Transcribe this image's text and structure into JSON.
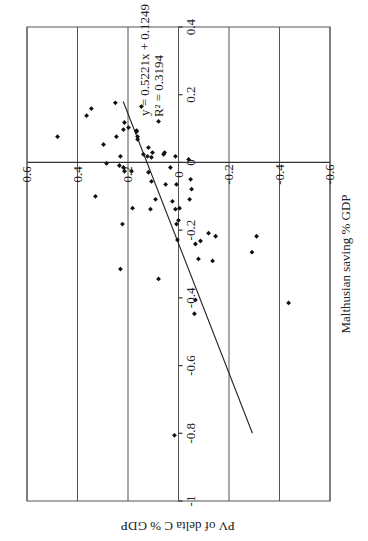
{
  "chart_data": {
    "type": "scatter",
    "orientation_note": "figure rotated 90 degrees clockwise on page",
    "title": "",
    "xlabel": "Malthusian saving % GDP",
    "ylabel": "PV of delta C % GDP",
    "xlim": [
      -1,
      0.4
    ],
    "ylim": [
      -0.6,
      0.6
    ],
    "x_ticks": [
      "-1",
      "-0.8",
      "-0.6",
      "-0.4",
      "-0.2",
      "0",
      "0.2",
      "0.4"
    ],
    "y_ticks": [
      "0.6",
      "0.4",
      "0.2",
      "0",
      "-0.2",
      "-0.4",
      "-0.6"
    ],
    "grid": true,
    "trendline": {
      "equation": "y = 0.5221x + 0.1249",
      "r_squared": "R² = 0.3194",
      "slope": 0.5221,
      "intercept": 0.1249,
      "x_range": [
        -0.8,
        0.18
      ]
    },
    "points": [
      {
        "x": 0.076,
        "y": 0.479
      },
      {
        "x": 0.138,
        "y": 0.364
      },
      {
        "x": 0.159,
        "y": 0.345
      },
      {
        "x": 0.176,
        "y": 0.25
      },
      {
        "x": 0.076,
        "y": 0.246
      },
      {
        "x": 0.053,
        "y": 0.297
      },
      {
        "x": 0.018,
        "y": 0.23
      },
      {
        "x": 0.118,
        "y": 0.214
      },
      {
        "x": 0.097,
        "y": 0.218
      },
      {
        "x": 0.103,
        "y": 0.198
      },
      {
        "x": 0.091,
        "y": 0.166
      },
      {
        "x": 0.076,
        "y": 0.162
      },
      {
        "x": 0.165,
        "y": 0.147
      },
      {
        "x": 0.121,
        "y": 0.079
      },
      {
        "x": 0.094,
        "y": 0.166
      },
      {
        "x": 0.068,
        "y": 0.162
      },
      {
        "x": 0.044,
        "y": 0.119
      },
      {
        "x": 0.029,
        "y": 0.103
      },
      {
        "x": 0.024,
        "y": 0.139
      },
      {
        "x": 0.018,
        "y": 0.123
      },
      {
        "x": 0.015,
        "y": 0.107
      },
      {
        "x": 0.024,
        "y": 0.059
      },
      {
        "x": 0.029,
        "y": 0.055
      },
      {
        "x": 0.018,
        "y": 0.012
      },
      {
        "x": 0.009,
        "y": -0.04
      },
      {
        "x": -0.003,
        "y": 0.285
      },
      {
        "x": -0.009,
        "y": 0.234
      },
      {
        "x": -0.015,
        "y": 0.218
      },
      {
        "x": -0.026,
        "y": 0.214
      },
      {
        "x": -0.026,
        "y": 0.186
      },
      {
        "x": -0.029,
        "y": 0.119
      },
      {
        "x": -0.056,
        "y": 0.107
      },
      {
        "x": -0.015,
        "y": 0.032
      },
      {
        "x": -0.065,
        "y": 0.051
      },
      {
        "x": -0.065,
        "y": 0.008
      },
      {
        "x": -0.05,
        "y": -0.048
      },
      {
        "x": -0.079,
        "y": -0.052
      },
      {
        "x": -0.109,
        "y": -0.044
      },
      {
        "x": -0.1,
        "y": 0.329
      },
      {
        "x": -0.135,
        "y": 0.182
      },
      {
        "x": -0.109,
        "y": 0.091
      },
      {
        "x": -0.138,
        "y": 0.111
      },
      {
        "x": -0.115,
        "y": 0.024
      },
      {
        "x": -0.138,
        "y": 0.012
      },
      {
        "x": -0.135,
        "y": -0.004
      },
      {
        "x": -0.209,
        "y": -0.119
      },
      {
        "x": -0.218,
        "y": -0.147
      },
      {
        "x": -0.171,
        "y": 0.0
      },
      {
        "x": -0.229,
        "y": 0.004
      },
      {
        "x": -0.182,
        "y": 0.008
      },
      {
        "x": -0.241,
        "y": -0.067
      },
      {
        "x": -0.232,
        "y": -0.087
      },
      {
        "x": -0.285,
        "y": -0.079
      },
      {
        "x": -0.291,
        "y": -0.135
      },
      {
        "x": -0.218,
        "y": -0.309
      },
      {
        "x": -0.265,
        "y": -0.291
      },
      {
        "x": -0.182,
        "y": 0.222
      },
      {
        "x": -0.315,
        "y": 0.23
      },
      {
        "x": -0.344,
        "y": 0.079
      },
      {
        "x": -0.406,
        "y": -0.067
      },
      {
        "x": -0.447,
        "y": -0.063
      },
      {
        "x": -0.415,
        "y": -0.436
      },
      {
        "x": -0.806,
        "y": 0.016
      }
    ]
  },
  "labels": {
    "equation": "y = 0.5221x + 0.1249",
    "r_squared": "R² = 0.3194",
    "xlabel": "Malthusian saving % GDP",
    "ylabel": "PV of delta C % GDP"
  }
}
